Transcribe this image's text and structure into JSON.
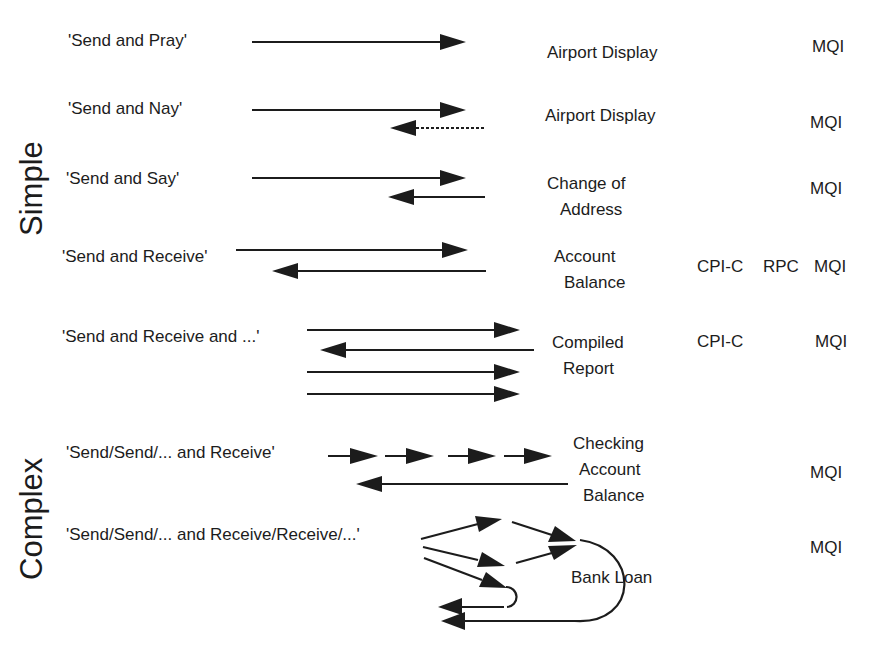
{
  "categories": {
    "simple": "Simple",
    "complex": "Complex"
  },
  "rows": [
    {
      "pattern": "'Send and Pray'",
      "example": [
        "Airport Display"
      ],
      "protocols": {
        "cpic": "",
        "rpc": "",
        "mqi": "MQI"
      }
    },
    {
      "pattern": "'Send and Nay'",
      "example": [
        "Airport Display"
      ],
      "protocols": {
        "cpic": "",
        "rpc": "",
        "mqi": "MQI"
      }
    },
    {
      "pattern": "'Send and Say'",
      "example": [
        "Change of",
        "Address"
      ],
      "protocols": {
        "cpic": "",
        "rpc": "",
        "mqi": "MQI"
      }
    },
    {
      "pattern": "'Send and Receive'",
      "example": [
        "Account",
        "Balance"
      ],
      "protocols": {
        "cpic": "CPI-C",
        "rpc": "RPC",
        "mqi": "MQI"
      }
    },
    {
      "pattern": "'Send and Receive and ...'",
      "example": [
        "Compiled",
        "Report"
      ],
      "protocols": {
        "cpic": "CPI-C",
        "rpc": "",
        "mqi": "MQI"
      }
    },
    {
      "pattern": "'Send/Send/... and Receive'",
      "example": [
        "Checking",
        "Account",
        "Balance"
      ],
      "protocols": {
        "cpic": "",
        "rpc": "",
        "mqi": "MQI"
      }
    },
    {
      "pattern": "'Send/Send/... and Receive/Receive/...'",
      "example": [
        "Bank Loan"
      ],
      "protocols": {
        "cpic": "",
        "rpc": "",
        "mqi": "MQI"
      }
    }
  ],
  "colors": {
    "ink": "#1c1c1c",
    "background": "#ffffff"
  }
}
